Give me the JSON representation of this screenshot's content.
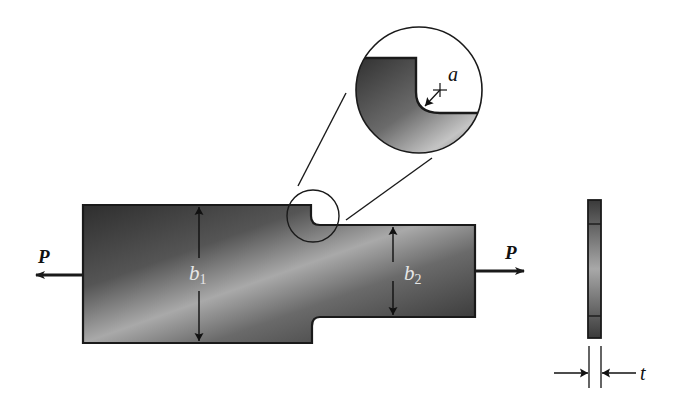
{
  "figure": {
    "colors": {
      "background": "#ffffff",
      "outline": "#1a1a1a",
      "fill_dark": "#3a3a3a",
      "fill_light": "#b8b8b8",
      "dim_label": "#e6e6e6"
    }
  },
  "loads": {
    "left": {
      "label": "P",
      "direction": "left"
    },
    "right": {
      "label": "P",
      "direction": "right"
    }
  },
  "dimensions": {
    "wide_width": {
      "symbol": "b",
      "subscript": "1"
    },
    "narrow_width": {
      "symbol": "b",
      "subscript": "2"
    },
    "fillet_radius": {
      "symbol": "a"
    },
    "thickness": {
      "symbol": "t"
    }
  },
  "views": {
    "plan": "front view of stepped bar",
    "detail": "magnified fillet detail",
    "side": "edge view showing thickness"
  }
}
